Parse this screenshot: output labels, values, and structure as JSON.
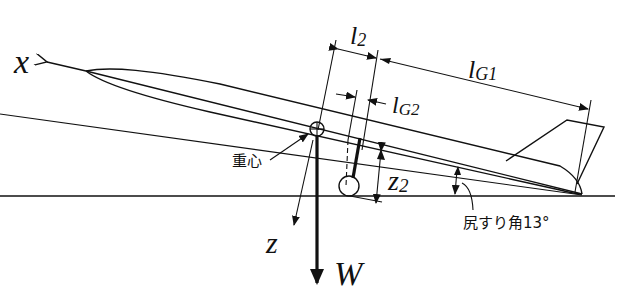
{
  "diagram": {
    "type": "aircraft tail-strike geometry (side view)",
    "labels": {
      "x_axis": "x",
      "z_axis": "z",
      "weight": "W",
      "l2_main": "l",
      "l2_sub": "2",
      "lG1_main": "l",
      "lG1_sub": "G1",
      "lG2_main": "l",
      "lG2_sub": "G2",
      "z2_main": "z",
      "z2_sub": "2",
      "cg_label": "重心",
      "tail_strike_label": "尻すり角13°"
    },
    "annotations": {
      "tail_strike_angle_deg": 13,
      "cg_meaning": "center of gravity",
      "tail_strike_meaning": "tail strike angle 13°"
    },
    "colors": {
      "ink": "#111111",
      "background": "#ffffff"
    }
  }
}
